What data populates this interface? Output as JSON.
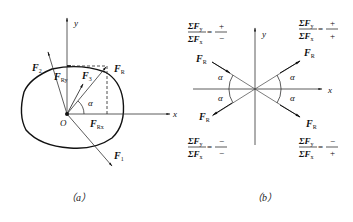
{
  "figure_a": {
    "caption": "（a）",
    "axis_x": "x",
    "axis_y": "y",
    "origin": "O",
    "angle": "α",
    "forces": {
      "f1": {
        "main": "F",
        "sub": "1"
      },
      "f2": {
        "main": "F",
        "sub": "2"
      },
      "f3": {
        "main": "F",
        "sub": "3"
      },
      "fr": {
        "main": "F",
        "sub": "R"
      },
      "fry": {
        "main": "F",
        "sub": "Ry"
      },
      "frx": {
        "main": "F",
        "sub": "Rx"
      }
    }
  },
  "figure_b": {
    "caption": "（b）",
    "axis_x": "x",
    "axis_y": "y",
    "angle": "α",
    "force_label": {
      "main": "F",
      "sub": "R"
    },
    "quadrants": {
      "upper_left": {
        "num": "ΣF",
        "num_sub": "y",
        "den": "ΣF",
        "den_sub": "x",
        "eq": "=",
        "sign_num": "+",
        "sign_den": "−"
      },
      "upper_right": {
        "num": "ΣF",
        "num_sub": "y",
        "den": "ΣF",
        "den_sub": "x",
        "eq": "=",
        "sign_num": "+",
        "sign_den": "+"
      },
      "lower_left": {
        "num": "ΣF",
        "num_sub": "y",
        "den": "ΣF",
        "den_sub": "x",
        "eq": "=",
        "sign_num": "−",
        "sign_den": "−"
      },
      "lower_right": {
        "num": "ΣF",
        "num_sub": "y",
        "den": "ΣF",
        "den_sub": "x",
        "eq": "=",
        "sign_num": "−",
        "sign_den": "+"
      }
    }
  },
  "colors": {
    "line": "#222222",
    "background": "#ffffff"
  }
}
